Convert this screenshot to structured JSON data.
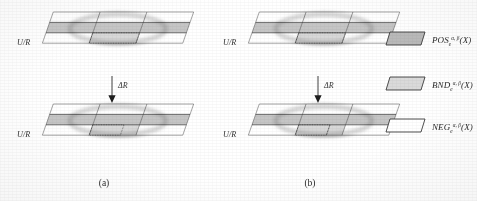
{
  "figure": {
    "caption_a": "(a)",
    "caption_b": "(b)",
    "axis_label": "U/R",
    "transition_label": "ΔR"
  },
  "panels": [
    {
      "id": "panel-a-top",
      "axis_label": "U/R",
      "rows": 3,
      "cols": 3,
      "shaded_cells": [
        "r1c0",
        "r1c1",
        "r1c2",
        "r2c1"
      ],
      "dotted_cells": [
        "r2c1"
      ],
      "set_shape": "ellipse"
    },
    {
      "id": "panel-a-bottom",
      "axis_label": "U/R",
      "rows": 3,
      "cols": 3,
      "shaded_cells": [
        "r1c0",
        "r1c1",
        "r1c2",
        "r2c1"
      ],
      "dotted_cells": [
        "r2c1"
      ],
      "set_shape": "ellipse"
    },
    {
      "id": "panel-b-top",
      "axis_label": "U/R",
      "rows": 3,
      "cols": 3,
      "shaded_cells": [
        "r1c0",
        "r1c1",
        "r1c2",
        "r2c1"
      ],
      "dotted_cells": [
        "r2c1"
      ],
      "set_shape": "ellipse"
    },
    {
      "id": "panel-b-bottom",
      "axis_label": "U/R",
      "rows": 3,
      "cols": 3,
      "shaded_cells": [
        "r1c0",
        "r1c1",
        "r1c2",
        "r2c1"
      ],
      "dotted_cells": [
        "r2c1"
      ],
      "set_shape": "ellipse"
    }
  ],
  "legend": {
    "items": [
      {
        "key": "pos",
        "base": "POS",
        "sub": "e",
        "sup": "α, β",
        "arg": "(X)",
        "swatch_fill": "#b9b9b9",
        "swatch_stroke": "#3a3a3a"
      },
      {
        "key": "bnd",
        "base": "BND",
        "sub": "e",
        "sup": "α, β",
        "arg": "(X)",
        "swatch_fill": "#dadada",
        "swatch_stroke": "#3a3a3a"
      },
      {
        "key": "neg",
        "base": "NEG",
        "sub": "e",
        "sup": "α, β",
        "arg": "(X)",
        "swatch_fill": "#ffffff",
        "swatch_stroke": "#3a3a3a"
      }
    ]
  },
  "colors": {
    "grid_line": "#3a3a3a",
    "grid_line_bold": "#202020",
    "pos_fill": "#b9b9b9",
    "bnd_fill": "#dadada",
    "neg_fill": "#ffffff",
    "ellipse_stroke": "#9a9a9a",
    "background": "#ffffff",
    "text": "#2b2b2b"
  }
}
